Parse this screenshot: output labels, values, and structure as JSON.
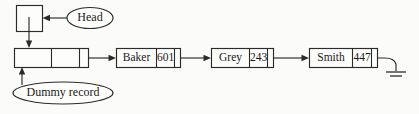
{
  "diagram": {
    "background_color": "#fbfbf9",
    "stroke_color": "#2b2b2b",
    "labels": {
      "head": "Head",
      "dummy_record": "Dummy record"
    },
    "head_pointer": {
      "name": "head-pointer-box",
      "value": ""
    },
    "dummy_node": {
      "name": "dummy-record-node",
      "cell_1": "",
      "cell_2": "",
      "pointer_cell": ""
    },
    "nodes": [
      {
        "name": "Baker",
        "number": "601",
        "pointer_cell": ""
      },
      {
        "name": "Grey",
        "number": "243",
        "pointer_cell": ""
      },
      {
        "name": "Smith",
        "number": "447",
        "pointer_cell": ""
      }
    ],
    "terminator": {
      "name": "null-ground-symbol",
      "symbol": "ground"
    }
  }
}
